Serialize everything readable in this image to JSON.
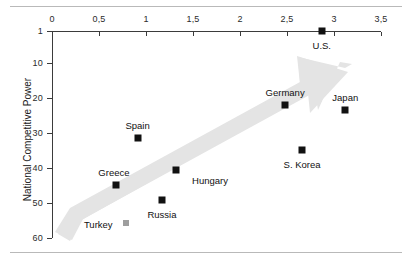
{
  "figure": {
    "has_top_rule": true,
    "has_bottom_rule": true,
    "rule_color": "#b9b9b9"
  },
  "chart_data": {
    "type": "scatter",
    "title": "",
    "xlabel": "",
    "ylabel": "National Competitive Power",
    "xlim": [
      0,
      3.5
    ],
    "ylim": [
      1,
      60
    ],
    "y_inverted": true,
    "x_axis_position": "top",
    "grid": false,
    "legend": null,
    "xticks": [
      0,
      0.5,
      1,
      1.5,
      2,
      2.5,
      3,
      3.5
    ],
    "xtick_labels": [
      "0",
      "0,5",
      "1",
      "1,5",
      "2",
      "2,5",
      "3",
      "3,5"
    ],
    "yticks": [
      1,
      10,
      20,
      30,
      40,
      50,
      60
    ],
    "ytick_labels": [
      "1",
      "10",
      "20",
      "30",
      "40",
      "50",
      "60"
    ],
    "marker_color": "#111111",
    "annotation": {
      "type": "arrow",
      "color": "#e2e2e2",
      "direction": "up-right",
      "description": "thick grey band arrow from lower-left to upper-right"
    },
    "points": [
      {
        "name": "U.S.",
        "x": 2.87,
        "y": 1,
        "label": "U.S.",
        "label_dx": 0,
        "label_dy": 14,
        "marker": "dark"
      },
      {
        "name": "Germany",
        "x": 2.48,
        "y": 22,
        "label": "Germany",
        "label_dx": 0,
        "label_dy": -13,
        "marker": "dark"
      },
      {
        "name": "Japan",
        "x": 3.12,
        "y": 23.5,
        "label": "Japan",
        "label_dx": 0,
        "label_dy": -13,
        "marker": "dark"
      },
      {
        "name": "Spain",
        "x": 0.91,
        "y": 31.5,
        "label": "Spain",
        "label_dx": 0,
        "label_dy": -13,
        "marker": "dark"
      },
      {
        "name": "S. Korea",
        "x": 2.66,
        "y": 35,
        "label": "S. Korea",
        "label_dx": 0,
        "label_dy": 14,
        "marker": "dark"
      },
      {
        "name": "Hungary",
        "x": 1.32,
        "y": 40.6,
        "label": "Hungary",
        "label_dx": 34,
        "label_dy": 10,
        "marker": "dark"
      },
      {
        "name": "Greece",
        "x": 0.68,
        "y": 45,
        "label": "Greece",
        "label_dx": -2,
        "label_dy": -13,
        "marker": "dark"
      },
      {
        "name": "Russia",
        "x": 1.17,
        "y": 49.2,
        "label": "Russia",
        "label_dx": 0,
        "label_dy": 14,
        "marker": "dark"
      },
      {
        "name": "Turkey",
        "x": 0.79,
        "y": 55.7,
        "label": "Turkey",
        "label_dx": -28,
        "label_dy": 1,
        "marker": "light"
      }
    ]
  }
}
